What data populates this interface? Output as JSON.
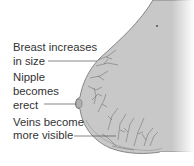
{
  "labels": {
    "size": [
      "Breast increases",
      "in size"
    ],
    "nipple": [
      "Nipple",
      "becomes",
      "erect"
    ],
    "veins": [
      "Veins become",
      "more visible"
    ]
  },
  "colors": {
    "skin": "#c9c9c9",
    "outline": "#6e6e6e",
    "veins": "#5a5a5a",
    "text": "#333333"
  }
}
